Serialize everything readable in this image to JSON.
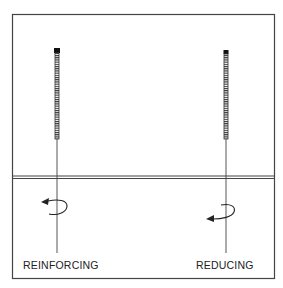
{
  "diagram": {
    "labels": {
      "left": "REINFORCING",
      "right": "REDUCING"
    },
    "needles": [
      {
        "name": "reinforcing-needle",
        "x": 57,
        "handle_top": 50,
        "handle_bottom": 139,
        "shaft_bottom": 253,
        "rotation": "counterclockwise-arrow"
      },
      {
        "name": "reducing-needle",
        "x": 226,
        "handle_top": 51,
        "handle_bottom": 139,
        "shaft_bottom": 253,
        "rotation": "clockwise-arrow"
      }
    ],
    "colors": {
      "line": "#333333",
      "background": "#ffffff"
    }
  }
}
